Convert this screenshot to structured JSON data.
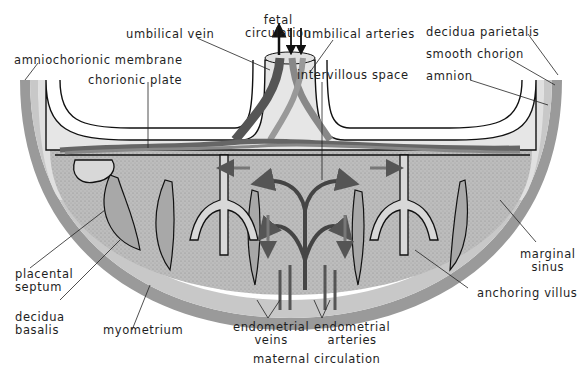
{
  "diagram": {
    "colors": {
      "background": "#ffffff",
      "myometrium": "#9a9a9a",
      "decidua": "#c4c4c4",
      "intervillous": "#b8b8b8",
      "chorionic_plate": "#dcdcdc",
      "vessel_dark": "#5a5a5a",
      "vessel_mid": "#808080",
      "outline": "#111111"
    },
    "labels": {
      "fetal_circulation": [
        "fetal",
        "circulation"
      ],
      "umbilical_vein": "umbilical vein",
      "umbilical_arteries": "umbilical arteries",
      "amniochorionic_membrane": "amniochorionic membrane",
      "chorionic_plate": "chorionic plate",
      "intervillous_space": "intervillous space",
      "decidua_parietalis": "decidua parietalis",
      "smooth_chorion": "smooth chorion",
      "amnion": "amnion",
      "placental_septum": [
        "placental",
        "septum"
      ],
      "decidua_basalis": [
        "decidua",
        "basalis"
      ],
      "myometrium": "myometrium",
      "endometrial_veins": [
        "endometrial",
        "veins"
      ],
      "endometrial_arteries": [
        "endometrial",
        "arteries"
      ],
      "maternal_circulation": "maternal circulation",
      "marginal_sinus": [
        "marginal",
        "sinus"
      ],
      "anchoring_villus": "anchoring villus"
    }
  }
}
